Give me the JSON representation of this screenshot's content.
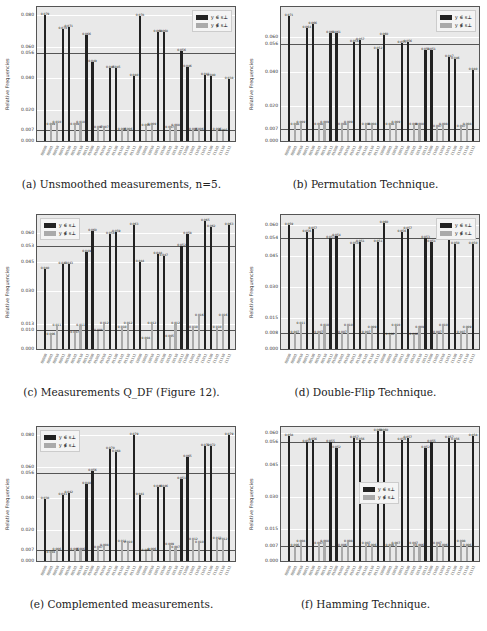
{
  "categories": [
    "00000",
    "00001",
    "00010",
    "00011",
    "00100",
    "00101",
    "00110",
    "00111",
    "01000",
    "01001",
    "01010",
    "01011",
    "01100",
    "01101",
    "01110",
    "01111",
    "10000",
    "10001",
    "10010",
    "10011",
    "10100",
    "10101",
    "10110",
    "10111",
    "11000",
    "11001",
    "11010",
    "11011",
    "11100",
    "11101",
    "11110",
    "11111"
  ],
  "legend": {
    "in": "y ∈ s⊥",
    "out": "y ∉ s⊥"
  },
  "colors": {
    "in": "#222222",
    "out": "#aaaaaa",
    "plot_bg": "#e9e9e9"
  },
  "chart_data": [
    {
      "id": "a",
      "type": "bar",
      "title": "(a) Unsmoothed measurements, n=5.",
      "ylabel": "Relative Frequencies",
      "ylim": [
        0,
        0.084
      ],
      "yticks": [
        0.0,
        0.007,
        0.02,
        0.04,
        0.056,
        0.06,
        0.08
      ],
      "ref_lines": [
        0.056,
        0.007
      ],
      "legend_position": "upper right",
      "series": [
        {
          "name": "y ∈ s⊥",
          "values": [
            0.079,
            0,
            0,
            0.07,
            0.071,
            0,
            0,
            0.066,
            0.049,
            0,
            0,
            0.045,
            0.045,
            0,
            0,
            0.04,
            0.078,
            0,
            0,
            0.068,
            0.068,
            0,
            0,
            0.056,
            0.046,
            0,
            0,
            0.041,
            0.04,
            0,
            0,
            0.038
          ]
        },
        {
          "name": "y ∉ s⊥",
          "values": [
            0,
            0.009,
            0.01,
            0,
            0,
            0.009,
            0.01,
            0,
            0,
            0.007,
            0.007,
            0,
            0,
            0.006,
            0.006,
            0,
            0,
            0.008,
            0.009,
            0,
            0,
            0.007,
            0.008,
            0,
            0,
            0.006,
            0.006,
            0,
            0,
            0.006,
            0.005,
            0
          ]
        }
      ]
    },
    {
      "id": "b",
      "type": "bar",
      "title": "(b) Permutation Technique.",
      "ylabel": "Relative Frequencies",
      "ylim": [
        0,
        0.076
      ],
      "yticks": [
        0.0,
        0.007,
        0.02,
        0.04,
        0.056,
        0.06
      ],
      "ref_lines": [
        0.056,
        0.007
      ],
      "legend_position": "upper right",
      "series": [
        {
          "name": "y ∈ s⊥",
          "values": [
            0.071,
            0,
            0,
            0.064,
            0.066,
            0,
            0,
            0.061,
            0.061,
            0,
            0,
            0.056,
            0.057,
            0,
            0,
            0.052,
            0.06,
            0,
            0,
            0.055,
            0.056,
            0,
            0,
            0.051,
            0.051,
            0,
            0,
            0.047,
            0.046,
            0,
            0,
            0.04
          ]
        },
        {
          "name": "y ∉ s⊥",
          "values": [
            0,
            0.008,
            0.009,
            0,
            0,
            0.008,
            0.009,
            0,
            0,
            0.008,
            0.009,
            0,
            0,
            0.008,
            0.008,
            0,
            0,
            0.008,
            0.009,
            0,
            0,
            0.008,
            0.008,
            0,
            0,
            0.007,
            0.008,
            0,
            0,
            0.007,
            0.008,
            0
          ]
        }
      ]
    },
    {
      "id": "c",
      "type": "bar",
      "title": "(c) Measurements Q_DF (Figure 12).",
      "ylabel": "Relative Frequencies",
      "ylim": [
        0,
        0.068
      ],
      "yticks": [
        0.0,
        0.01,
        0.013,
        0.03,
        0.045,
        0.053,
        0.06
      ],
      "ref_lines": [
        0.053,
        0.01
      ],
      "legend_position": "upper left",
      "series": [
        {
          "name": "y ∈ s⊥",
          "values": [
            0.04,
            0,
            0,
            0.043,
            0.043,
            0,
            0,
            0.049,
            0.06,
            0,
            0,
            0.058,
            0.059,
            0,
            0,
            0.063,
            0.044,
            0,
            0,
            0.048,
            0.047,
            0,
            0,
            0.052,
            0.058,
            0,
            0,
            0.065,
            0.062,
            0,
            0,
            0.063
          ]
        },
        {
          "name": "y ∉ s⊥",
          "values": [
            0,
            0.006,
            0.011,
            0,
            0,
            0.007,
            0.011,
            0,
            0,
            0.008,
            0.012,
            0,
            0,
            0.01,
            0.012,
            0,
            0,
            0.004,
            0.012,
            0,
            0,
            0.005,
            0.012,
            0,
            0,
            0.01,
            0.016,
            0,
            0,
            0.01,
            0.016,
            0
          ]
        }
      ]
    },
    {
      "id": "d",
      "type": "bar",
      "title": "(d) Double-Flip Technique.",
      "ylabel": "Relative Frequencies",
      "ylim": [
        0,
        0.064
      ],
      "yticks": [
        0.0,
        0.008,
        0.015,
        0.03,
        0.045,
        0.054,
        0.06
      ],
      "ref_lines": [
        0.054,
        0.008
      ],
      "legend_position": "upper right",
      "series": [
        {
          "name": "y ∈ s⊥",
          "values": [
            0.059,
            0,
            0,
            0.056,
            0.057,
            0,
            0,
            0.053,
            0.054,
            0,
            0,
            0.05,
            0.051,
            0,
            0,
            0.051,
            0.06,
            0,
            0,
            0.056,
            0.057,
            0,
            0,
            0.053,
            0.051,
            0,
            0,
            0.053,
            0.05,
            0,
            0,
            0.05
          ]
        },
        {
          "name": "y ∉ s⊥",
          "values": [
            0,
            0.007,
            0.011,
            0,
            0,
            0.007,
            0.01,
            0,
            0,
            0.007,
            0.01,
            0,
            0,
            0.007,
            0.009,
            0,
            0,
            0.006,
            0.01,
            0,
            0,
            0.006,
            0.009,
            0,
            0,
            0.007,
            0.01,
            0,
            0,
            0.007,
            0.009,
            0
          ]
        }
      ]
    },
    {
      "id": "e",
      "type": "bar",
      "title": "(e) Complemented measurements.",
      "ylabel": "Relative Frequencies",
      "ylim": [
        0,
        0.084
      ],
      "yticks": [
        0.0,
        0.007,
        0.02,
        0.04,
        0.056,
        0.06,
        0.08
      ],
      "ref_lines": [
        0.056,
        0.007
      ],
      "legend_position": "upper left",
      "series": [
        {
          "name": "y ∈ s⊥",
          "values": [
            0.038,
            0,
            0,
            0.041,
            0.042,
            0,
            0,
            0.048,
            0.056,
            0,
            0,
            0.07,
            0.068,
            0,
            0,
            0.079,
            0.041,
            0,
            0,
            0.046,
            0.046,
            0,
            0,
            0.051,
            0.065,
            0,
            0,
            0.072,
            0.072,
            0,
            0,
            0.079
          ]
        },
        {
          "name": "y ∉ s⊥",
          "values": [
            0,
            0.004,
            0.006,
            0,
            0,
            0.006,
            0.006,
            0,
            0,
            0.007,
            0.008,
            0,
            0,
            0.011,
            0.01,
            0,
            0,
            0.005,
            0.006,
            0,
            0,
            0.009,
            0.007,
            0,
            0,
            0.012,
            0.01,
            0,
            0,
            0.013,
            0.012,
            0
          ]
        }
      ]
    },
    {
      "id": "f",
      "type": "bar",
      "title": "(f) Hamming Technique.",
      "ylabel": "Relative Frequencies",
      "ylim": [
        0,
        0.062
      ],
      "yticks": [
        0.0,
        0.007,
        0.015,
        0.03,
        0.045,
        0.056,
        0.06
      ],
      "ref_lines": [
        0.056,
        0.007
      ],
      "legend_position": "center",
      "series": [
        {
          "name": "y ∈ s⊥",
          "values": [
            0.058,
            0,
            0,
            0.055,
            0.056,
            0,
            0,
            0.055,
            0.052,
            0,
            0,
            0.057,
            0.056,
            0,
            0,
            0.06,
            0.06,
            0,
            0,
            0.056,
            0.057,
            0,
            0,
            0.052,
            0.055,
            0,
            0,
            0.057,
            0.056,
            0,
            0,
            0.058
          ]
        },
        {
          "name": "y ∉ s⊥",
          "values": [
            0,
            0.006,
            0.008,
            0,
            0,
            0.007,
            0.008,
            0,
            0,
            0.006,
            0.008,
            0,
            0,
            0.007,
            0.006,
            0,
            0,
            0.006,
            0.007,
            0,
            0,
            0.007,
            0.006,
            0,
            0,
            0.007,
            0.006,
            0,
            0,
            0.008,
            0.006,
            0
          ]
        }
      ]
    }
  ]
}
